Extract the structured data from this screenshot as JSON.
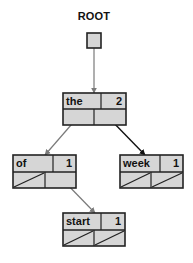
{
  "diagram": {
    "title": "ROOT",
    "colors": {
      "node_fill": "#d6d6d6",
      "node_border": "#222222",
      "arrow_gray": "#7a7a7a",
      "arrow_black": "#111111"
    },
    "root_pointer": {
      "x": 87,
      "y": 33,
      "w": 14,
      "h": 15
    },
    "nodes": [
      {
        "id": "the",
        "word": "the",
        "count": "2",
        "x": 63,
        "y": 93,
        "w": 63,
        "h": 32,
        "split_top": 101,
        "split_bottom": 94,
        "left_null": false,
        "right_null": false
      },
      {
        "id": "of",
        "word": "of",
        "count": "1",
        "x": 13,
        "y": 155,
        "w": 63,
        "h": 33,
        "split_top": 53,
        "split_bottom": 45,
        "left_null": true,
        "right_null": false
      },
      {
        "id": "week",
        "word": "week",
        "count": "1",
        "x": 120,
        "y": 155,
        "w": 63,
        "h": 33,
        "split_top": 160,
        "split_bottom": 151,
        "left_null": true,
        "right_null": true
      },
      {
        "id": "start",
        "word": "start",
        "count": "1",
        "x": 63,
        "y": 213,
        "w": 62,
        "h": 33,
        "split_top": 101,
        "split_bottom": 94,
        "left_null": true,
        "right_null": true
      }
    ],
    "edges": [
      {
        "from": "ROOT",
        "to": "the",
        "x1": 94,
        "y1": 40,
        "x2": 94,
        "y2": 93,
        "color": "gray"
      },
      {
        "from": "the.left",
        "to": "of",
        "x1": 78,
        "y1": 117,
        "x2": 45,
        "y2": 155,
        "color": "gray"
      },
      {
        "from": "the.right",
        "to": "week",
        "x1": 108,
        "y1": 117,
        "x2": 145,
        "y2": 155,
        "color": "black"
      },
      {
        "from": "of.right",
        "to": "start",
        "x1": 61,
        "y1": 178,
        "x2": 95,
        "y2": 213,
        "color": "gray"
      }
    ]
  }
}
